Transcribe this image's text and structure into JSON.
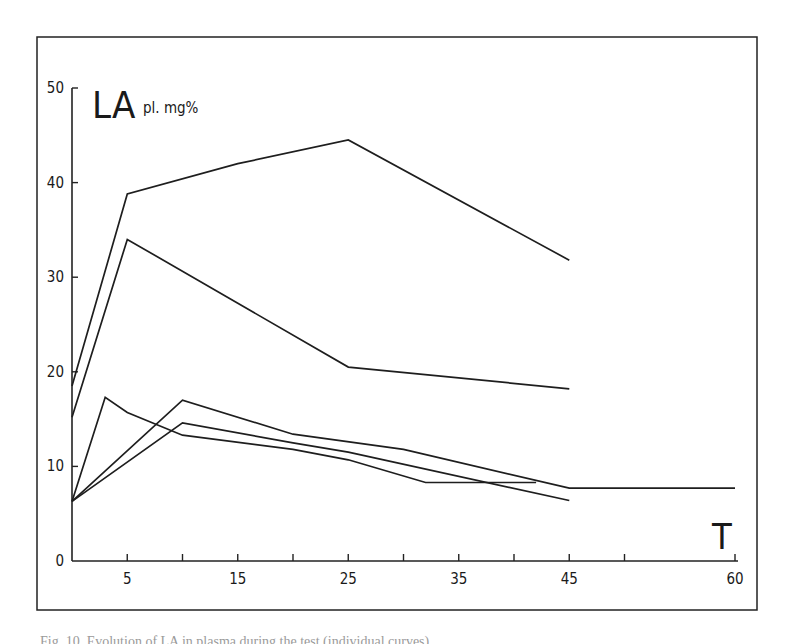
{
  "chart_data": {
    "type": "line",
    "title": "",
    "ylabel": "LA pl. mg%",
    "ylabel_main": "LA",
    "ylabel_sub": "pl. mg%",
    "xlabel": "T",
    "xlim": [
      0,
      60
    ],
    "ylim": [
      0,
      50
    ],
    "grid": false,
    "legend": null,
    "x_ticks": [
      0,
      5,
      10,
      15,
      20,
      25,
      30,
      35,
      40,
      45,
      50,
      60
    ],
    "x_tick_labels": [
      "5",
      "15",
      "25",
      "35",
      "45",
      "60"
    ],
    "x_tick_label_values": [
      5,
      15,
      25,
      35,
      45,
      60
    ],
    "y_ticks": [
      0,
      10,
      20,
      30,
      40,
      50
    ],
    "y_tick_labels": [
      "0",
      "10",
      "20",
      "30",
      "40",
      "50"
    ],
    "series": [
      {
        "name": "curve-1",
        "x": [
          0,
          5,
          15,
          25,
          45
        ],
        "y": [
          18.5,
          38.8,
          42.0,
          44.5,
          31.8
        ]
      },
      {
        "name": "curve-2",
        "x": [
          0,
          5,
          25,
          45
        ],
        "y": [
          15.2,
          34.0,
          20.5,
          18.2
        ]
      },
      {
        "name": "curve-3",
        "x": [
          0,
          10,
          20,
          30,
          45,
          60
        ],
        "y": [
          6.3,
          17.0,
          13.4,
          11.8,
          7.7,
          7.7
        ]
      },
      {
        "name": "curve-4",
        "x": [
          0,
          10,
          20,
          25,
          45
        ],
        "y": [
          6.3,
          14.6,
          12.5,
          11.5,
          6.4
        ]
      },
      {
        "name": "curve-5",
        "x": [
          0,
          3,
          5,
          10,
          20,
          25,
          32,
          42
        ],
        "y": [
          6.3,
          17.3,
          15.7,
          13.3,
          11.8,
          10.7,
          8.3,
          8.3
        ]
      }
    ]
  },
  "caption": "Fig. 10. Evolution of LA in plasma during the test (individual curves)..."
}
